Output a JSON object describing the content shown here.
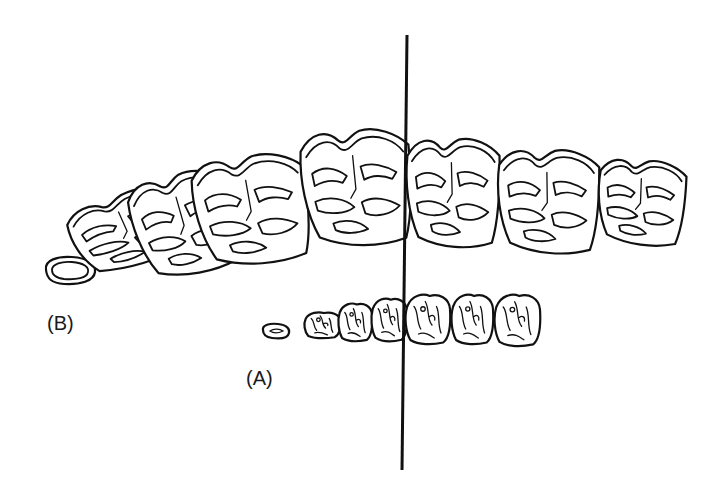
{
  "figure": {
    "labels": {
      "row_b": "(B)",
      "row_a": "(A)"
    },
    "rows": [
      {
        "id": "B",
        "name": "large tooth row",
        "tooth_count": 7,
        "position": "upper"
      },
      {
        "id": "A",
        "name": "small tooth row",
        "tooth_count": 7,
        "position": "lower"
      }
    ],
    "reference_line": "vertical alignment line",
    "colors": {
      "ink": "#111111",
      "background": "#ffffff"
    }
  }
}
